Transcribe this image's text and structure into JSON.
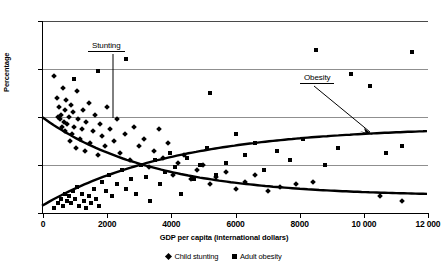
{
  "chart_data": {
    "type": "scatter",
    "title": "",
    "xlabel": "GDP per capita (international dollars)",
    "ylabel": "Percentage",
    "xlim": [
      0,
      12000
    ],
    "ylim": [
      0,
      80
    ],
    "xticks": [
      0,
      2000,
      4000,
      6000,
      8000,
      10000,
      12000
    ],
    "xticklabels": [
      "0",
      "2000",
      "4000",
      "6000",
      "8000",
      "10 000",
      "12 000"
    ],
    "yticks": [
      0,
      20,
      40,
      60,
      80
    ],
    "yticklabels": [
      "0",
      "20",
      "40",
      "60",
      "80"
    ],
    "grid": "horizontal",
    "legend_position": "below-axis",
    "marker_color": "#000000",
    "gridline_color": "#8f8f8f",
    "series": [
      {
        "name": "Child stunting",
        "marker": "diamond",
        "trend": "decreasing",
        "trend_start_value": 40,
        "trend_end_value": 7,
        "points": [
          [
            330,
            57
          ],
          [
            430,
            48
          ],
          [
            470,
            40
          ],
          [
            500,
            44
          ],
          [
            520,
            39
          ],
          [
            560,
            41
          ],
          [
            590,
            36
          ],
          [
            620,
            52
          ],
          [
            650,
            38
          ],
          [
            680,
            43
          ],
          [
            700,
            34
          ],
          [
            730,
            47
          ],
          [
            760,
            37
          ],
          [
            800,
            40
          ],
          [
            830,
            30
          ],
          [
            870,
            45
          ],
          [
            900,
            33
          ],
          [
            940,
            42
          ],
          [
            980,
            36
          ],
          [
            1020,
            27
          ],
          [
            1060,
            51
          ],
          [
            1100,
            39
          ],
          [
            1150,
            31
          ],
          [
            1200,
            35
          ],
          [
            1250,
            43
          ],
          [
            1300,
            26
          ],
          [
            1350,
            38
          ],
          [
            1420,
            46
          ],
          [
            1480,
            29
          ],
          [
            1550,
            34
          ],
          [
            1620,
            41
          ],
          [
            1700,
            24
          ],
          [
            1780,
            37
          ],
          [
            1850,
            32
          ],
          [
            1920,
            28
          ],
          [
            2000,
            44
          ],
          [
            2100,
            35
          ],
          [
            2200,
            30
          ],
          [
            2300,
            39
          ],
          [
            2400,
            25
          ],
          [
            2550,
            33
          ],
          [
            2700,
            22
          ],
          [
            2850,
            36
          ],
          [
            3000,
            28
          ],
          [
            3150,
            31
          ],
          [
            3300,
            19
          ],
          [
            3450,
            26
          ],
          [
            3600,
            35
          ],
          [
            3750,
            23
          ],
          [
            3900,
            29
          ],
          [
            4050,
            16
          ],
          [
            4200,
            21
          ],
          [
            4400,
            24
          ],
          [
            4600,
            14
          ],
          [
            4800,
            18
          ],
          [
            5000,
            20
          ],
          [
            5200,
            12
          ],
          [
            5400,
            15
          ],
          [
            5700,
            17
          ],
          [
            6000,
            10
          ],
          [
            6300,
            13
          ],
          [
            6600,
            16
          ],
          [
            7000,
            9
          ],
          [
            7400,
            11
          ],
          [
            7900,
            12
          ],
          [
            8400,
            13
          ],
          [
            10500,
            7
          ],
          [
            11200,
            5
          ]
        ]
      },
      {
        "name": "Adult obesity",
        "marker": "square",
        "trend": "increasing",
        "trend_start_value": 3,
        "trend_end_value": 36,
        "points": [
          [
            350,
            2
          ],
          [
            480,
            4
          ],
          [
            560,
            6
          ],
          [
            620,
            3
          ],
          [
            700,
            8
          ],
          [
            760,
            5
          ],
          [
            820,
            7
          ],
          [
            880,
            4
          ],
          [
            940,
            9
          ],
          [
            1000,
            6
          ],
          [
            1060,
            11
          ],
          [
            1120,
            3
          ],
          [
            1200,
            8
          ],
          [
            1280,
            5
          ],
          [
            1350,
            2
          ],
          [
            1420,
            7
          ],
          [
            1500,
            4
          ],
          [
            1580,
            10
          ],
          [
            1660,
            6
          ],
          [
            1750,
            3
          ],
          [
            1850,
            13
          ],
          [
            1950,
            9
          ],
          [
            2050,
            16
          ],
          [
            2150,
            7
          ],
          [
            2300,
            12
          ],
          [
            2450,
            18
          ],
          [
            2600,
            10
          ],
          [
            2750,
            14
          ],
          [
            2900,
            8
          ],
          [
            3050,
            20
          ],
          [
            3200,
            15
          ],
          [
            3350,
            5
          ],
          [
            3500,
            22
          ],
          [
            3650,
            12
          ],
          [
            3800,
            17
          ],
          [
            3950,
            25
          ],
          [
            4100,
            19
          ],
          [
            4300,
            8
          ],
          [
            4500,
            23
          ],
          [
            4700,
            14
          ],
          [
            4900,
            20
          ],
          [
            5100,
            27
          ],
          [
            5400,
            16
          ],
          [
            5700,
            21
          ],
          [
            6000,
            33
          ],
          [
            6300,
            24
          ],
          [
            6600,
            29
          ],
          [
            6900,
            18
          ],
          [
            7300,
            26
          ],
          [
            7700,
            22
          ],
          [
            8100,
            31
          ],
          [
            8500,
            68
          ],
          [
            8800,
            20
          ],
          [
            9200,
            27
          ],
          [
            9600,
            58
          ],
          [
            10200,
            53
          ],
          [
            10700,
            25
          ],
          [
            11200,
            28
          ],
          [
            11500,
            67
          ],
          [
            2600,
            64
          ],
          [
            1700,
            59
          ],
          [
            5200,
            50
          ],
          [
            980,
            56
          ]
        ]
      }
    ],
    "annotations": [
      {
        "label": "Stunting",
        "leader": "vertical-line"
      },
      {
        "label": "Obesity",
        "leader": "diagonal-arrow"
      }
    ]
  },
  "axis": {
    "ylabel": "Percentage",
    "xlabel": "GDP per capita (international dollars)"
  },
  "legend": {
    "items": [
      {
        "label": "Child stunting",
        "marker": "diamond"
      },
      {
        "label": "Adult obesity",
        "marker": "square"
      }
    ]
  },
  "annotations": {
    "stunting": "Stunting",
    "obesity": "Obesity"
  }
}
